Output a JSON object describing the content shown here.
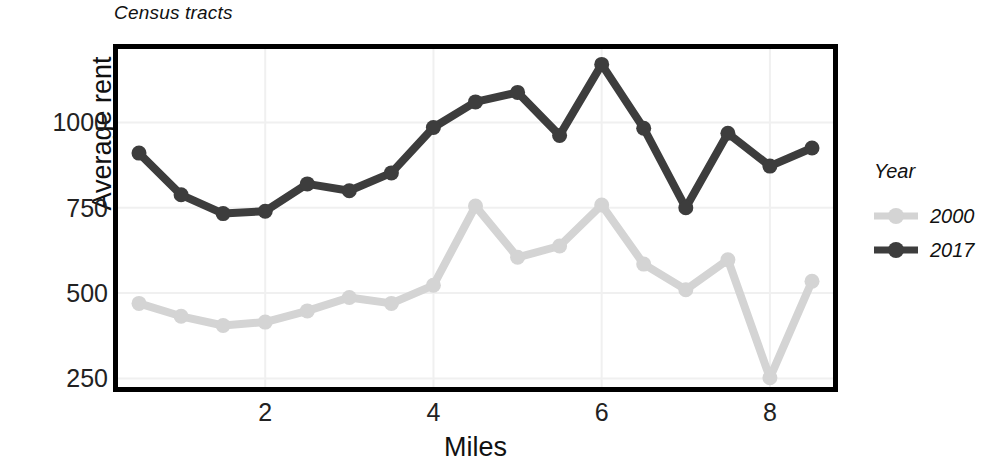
{
  "chart_data": {
    "type": "line",
    "title": "Census tracts",
    "xlabel": "Miles",
    "ylabel": "Average rent",
    "xlim": [
      0.25,
      8.75
    ],
    "ylim": [
      225,
      1215
    ],
    "xticks": [
      2,
      4,
      6,
      8
    ],
    "yticks": [
      250,
      500,
      750,
      1000
    ],
    "grid": true,
    "legend": {
      "title": "Year",
      "position": "right",
      "entries": [
        {
          "label": "2000",
          "color": "#d4d4d4"
        },
        {
          "label": "2017",
          "color": "#3d3d3d"
        }
      ]
    },
    "x": [
      0.5,
      1.0,
      1.5,
      2.0,
      2.5,
      3.0,
      3.5,
      4.0,
      4.5,
      5.0,
      5.5,
      6.0,
      6.5,
      7.0,
      7.5,
      8.0,
      8.5
    ],
    "series": [
      {
        "name": "2000",
        "color": "#d4d4d4",
        "values": [
          470,
          432,
          405,
          415,
          448,
          487,
          470,
          523,
          755,
          605,
          638,
          758,
          585,
          510,
          598,
          252,
          535
        ]
      },
      {
        "name": "2017",
        "color": "#3d3d3d",
        "values": [
          910,
          788,
          733,
          740,
          820,
          800,
          852,
          985,
          1060,
          1088,
          962,
          1170,
          983,
          750,
          968,
          872,
          925
        ]
      }
    ]
  }
}
